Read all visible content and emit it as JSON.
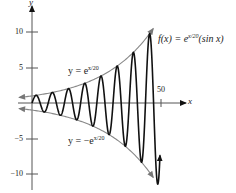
{
  "chart_data": {
    "type": "line",
    "title": "",
    "xlabel": "x",
    "ylabel": "y",
    "xlim": [
      -5,
      58
    ],
    "ylim": [
      -12,
      13
    ],
    "x_ticks": [
      50
    ],
    "x_tick_labels": [
      "50"
    ],
    "y_ticks": [
      10,
      5,
      -5,
      -10
    ],
    "y_tick_labels": [
      "10",
      "5",
      "-5",
      "-10"
    ],
    "grid": false,
    "legend": "none",
    "series": [
      {
        "name": "f(x) = e^(x/20)(sin x)",
        "expression": "exp(x/20)*sin(x)",
        "x_range": [
          0,
          50
        ],
        "color": "#111111",
        "stroke_width": 1.6,
        "end_arrow": true
      },
      {
        "name": "y = e^(x/20)",
        "expression": "exp(x/20)",
        "x_range": [
          -5,
          47
        ],
        "color": "#888888",
        "stroke_width": 1.1,
        "both_arrows": true
      },
      {
        "name": "y = -e^(x/20)",
        "expression": "-exp(x/20)",
        "x_range": [
          -5,
          47
        ],
        "color": "#888888",
        "stroke_width": 1.1,
        "both_arrows": true
      }
    ],
    "annotations": [
      {
        "text": "f(x) = e^(x/20)(sin x)",
        "position": "upper right"
      },
      {
        "text": "y = e^(x/20)",
        "position": "above upper envelope"
      },
      {
        "text": "y = -e^(x/20)",
        "position": "below lower envelope"
      }
    ]
  },
  "labels": {
    "y_axis": "y",
    "x_axis": "x",
    "tick_10": "10",
    "tick_5": "5",
    "tick_m5": "−5",
    "tick_m10": "−10",
    "tick_50": "50",
    "f_label_pre": "f(x) = e",
    "f_label_sup": "x/20",
    "f_label_post": "(sin x)",
    "upper_pre": "y = e",
    "upper_sup": "x/20",
    "lower_pre": "y = −e",
    "lower_sup": "x/20"
  }
}
